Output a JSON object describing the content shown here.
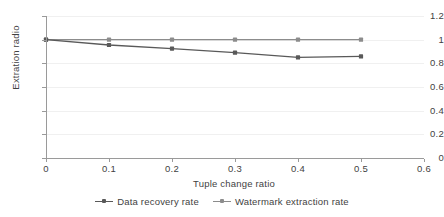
{
  "chart_data": {
    "type": "line",
    "title": "",
    "xlabel": "Tuple change ratio",
    "ylabel": "Extration radio",
    "x": [
      0,
      0.1,
      0.2,
      0.3,
      0.4,
      0.5
    ],
    "xlim": [
      0,
      0.6
    ],
    "ylim": [
      0,
      1.2
    ],
    "xticks": [
      "0",
      "0.1",
      "0.2",
      "0.3",
      "0.4",
      "0.5",
      "0.6"
    ],
    "xtick_values": [
      0,
      0.1,
      0.2,
      0.3,
      0.4,
      0.5,
      0.6
    ],
    "yticks": [
      "0",
      "0.2",
      "0.4",
      "0.6",
      "0.8",
      "1",
      "1.2"
    ],
    "ytick_values": [
      0,
      0.2,
      0.4,
      0.6,
      0.8,
      1.0,
      1.2
    ],
    "grid": true,
    "grid_axis": "y",
    "legend_position": "bottom-center",
    "series": [
      {
        "name": "Data recovery rate",
        "values": [
          1.0,
          0.955,
          0.925,
          0.89,
          0.85,
          0.858
        ],
        "color": "#595959",
        "marker": "square"
      },
      {
        "name": "Watermark extraction rate",
        "values": [
          1.0,
          1.0,
          1.0,
          1.0,
          1.0,
          1.0
        ],
        "color": "#8c8c8c",
        "marker": "square"
      }
    ]
  },
  "legend": {
    "items": [
      {
        "label": "Data recovery rate"
      },
      {
        "label": "Watermark extraction rate"
      }
    ]
  },
  "axes": {
    "x_title": "Tuple change ratio",
    "y_title": "Extration radio"
  }
}
